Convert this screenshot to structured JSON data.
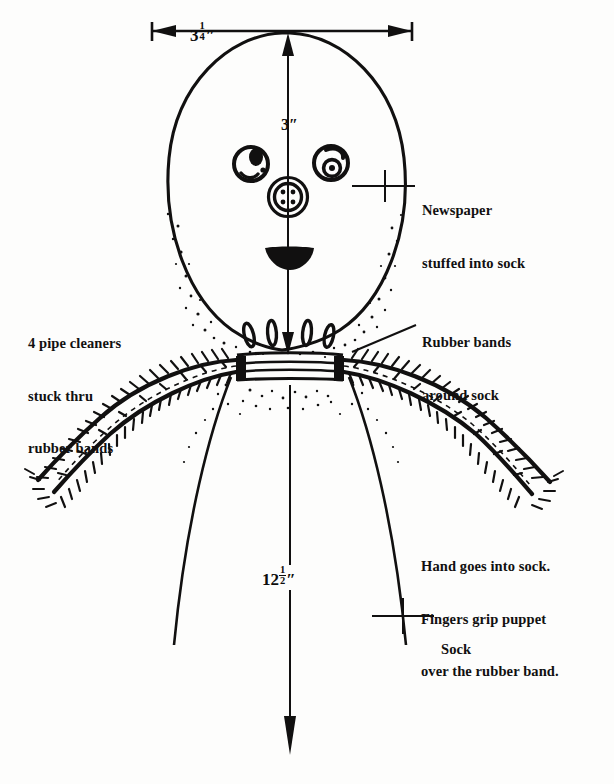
{
  "figure": {
    "kind": "instructional-line-drawing",
    "ink_color": "#111010",
    "paper_color": "#fdfdfc"
  },
  "dimensions": {
    "width": {
      "whole": "3",
      "num": "1",
      "den": "4",
      "unit": "″",
      "name": "head-width"
    },
    "head_height": {
      "whole": "3",
      "unit": "″",
      "name": "head-height"
    },
    "sock_length": {
      "whole": "12",
      "num": "1",
      "den": "2",
      "unit": "″",
      "name": "sock-length"
    }
  },
  "annotations": {
    "newspaper": {
      "lines": [
        "Newspaper",
        "stuffed into sock"
      ]
    },
    "pipe_cleaners": {
      "lines": [
        "4 pipe cleaners",
        "stuck thru",
        "rubber bands"
      ]
    },
    "rubber_bands": {
      "lines": [
        "Rubber bands",
        "around sock"
      ]
    },
    "hand": {
      "lines": [
        "Hand goes into sock.",
        "Fingers grip puppet",
        "over the rubber band."
      ]
    },
    "sock": {
      "lines": [
        "Sock"
      ]
    }
  },
  "parts": {
    "head": "newspaper-stuffed-head",
    "left_eye": "button-eye-left",
    "right_eye": "button-eye-right",
    "nose": "four-hole-button-nose",
    "mouth": "mouth",
    "neck": "rubber-band-neck",
    "left_arm": "pipe-cleaner-arm-left",
    "right_arm": "pipe-cleaner-arm-right",
    "body": "sock-body"
  }
}
